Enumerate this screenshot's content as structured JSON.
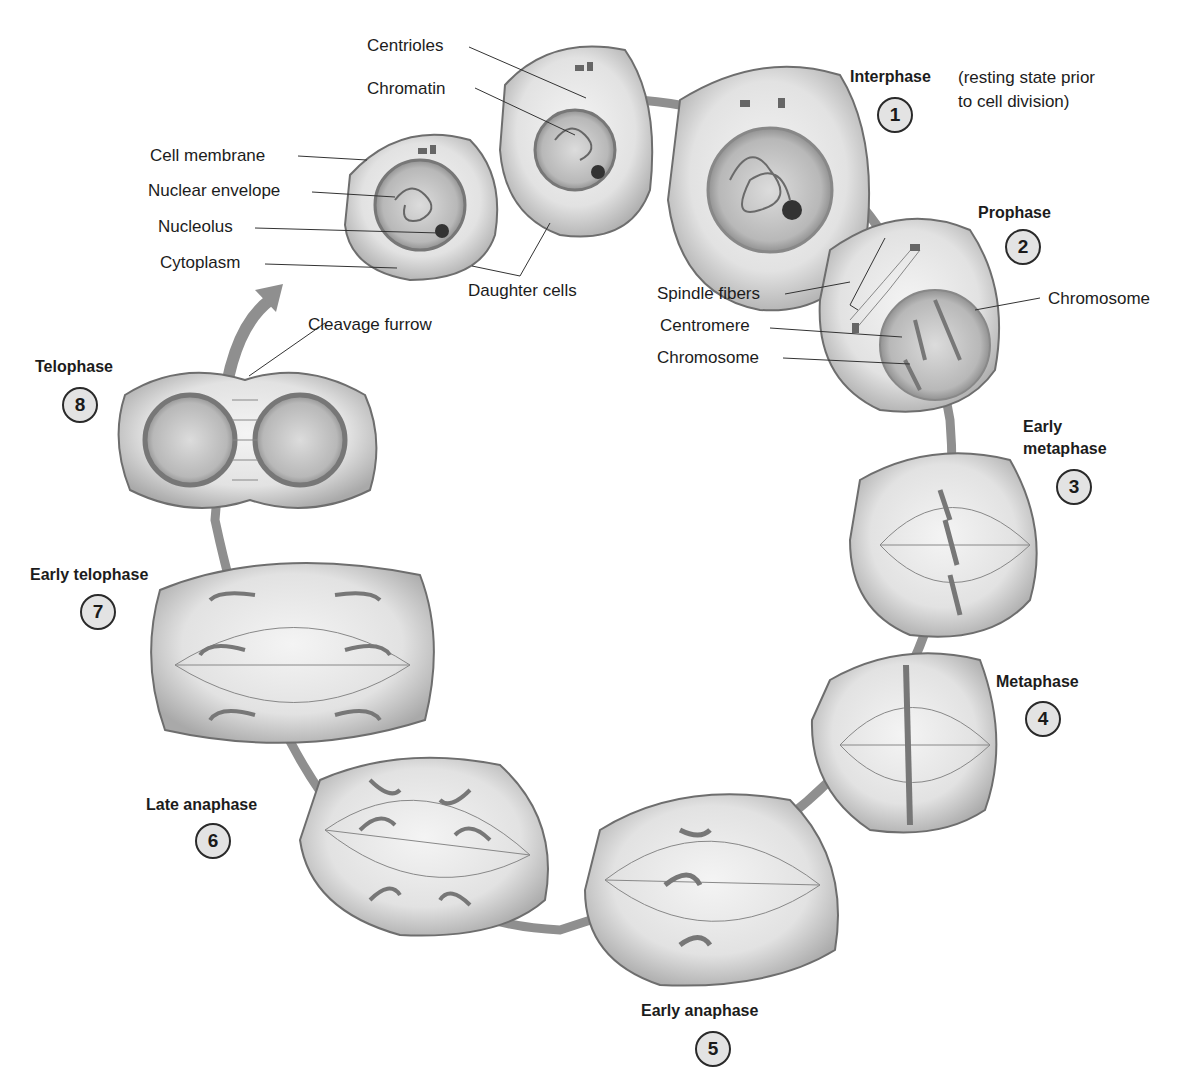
{
  "figure": {
    "type": "mitosis cell-cycle diagram",
    "cycle_direction": "clockwise"
  },
  "phases": [
    {
      "number": "1",
      "name": "Interphase",
      "note": "(resting state prior to cell division)",
      "note_line1": "(resting state prior",
      "note_line2": "to cell division)"
    },
    {
      "number": "2",
      "name": "Prophase"
    },
    {
      "number": "3",
      "name": "Early metaphase",
      "name_line1": "Early",
      "name_line2": "metaphase"
    },
    {
      "number": "4",
      "name": "Metaphase"
    },
    {
      "number": "5",
      "name": "Early anaphase"
    },
    {
      "number": "6",
      "name": "Late anaphase"
    },
    {
      "number": "7",
      "name": "Early telophase"
    },
    {
      "number": "8",
      "name": "Telophase"
    }
  ],
  "callouts": {
    "centrioles": "Centrioles",
    "chromatin": "Chromatin",
    "cell_membrane": "Cell membrane",
    "nuclear_envelope": "Nuclear envelope",
    "nucleolus": "Nucleolus",
    "cytoplasm": "Cytoplasm",
    "daughter_cells": "Daughter cells",
    "cleavage_furrow": "Cleavage furrow",
    "spindle_fibers": "Spindle fibers",
    "centromere": "Centromere",
    "chromosome_left": "Chromosome",
    "chromosome_right": "Chromosome"
  },
  "colors": {
    "cell_fill": "#d2d2d2",
    "cell_edge": "#6e6e6e",
    "nucleus_fill": "#9a9a9a",
    "ring": "#8f8f8f",
    "badge_fill": "#e3e3e3",
    "text": "#1c1c1c"
  }
}
